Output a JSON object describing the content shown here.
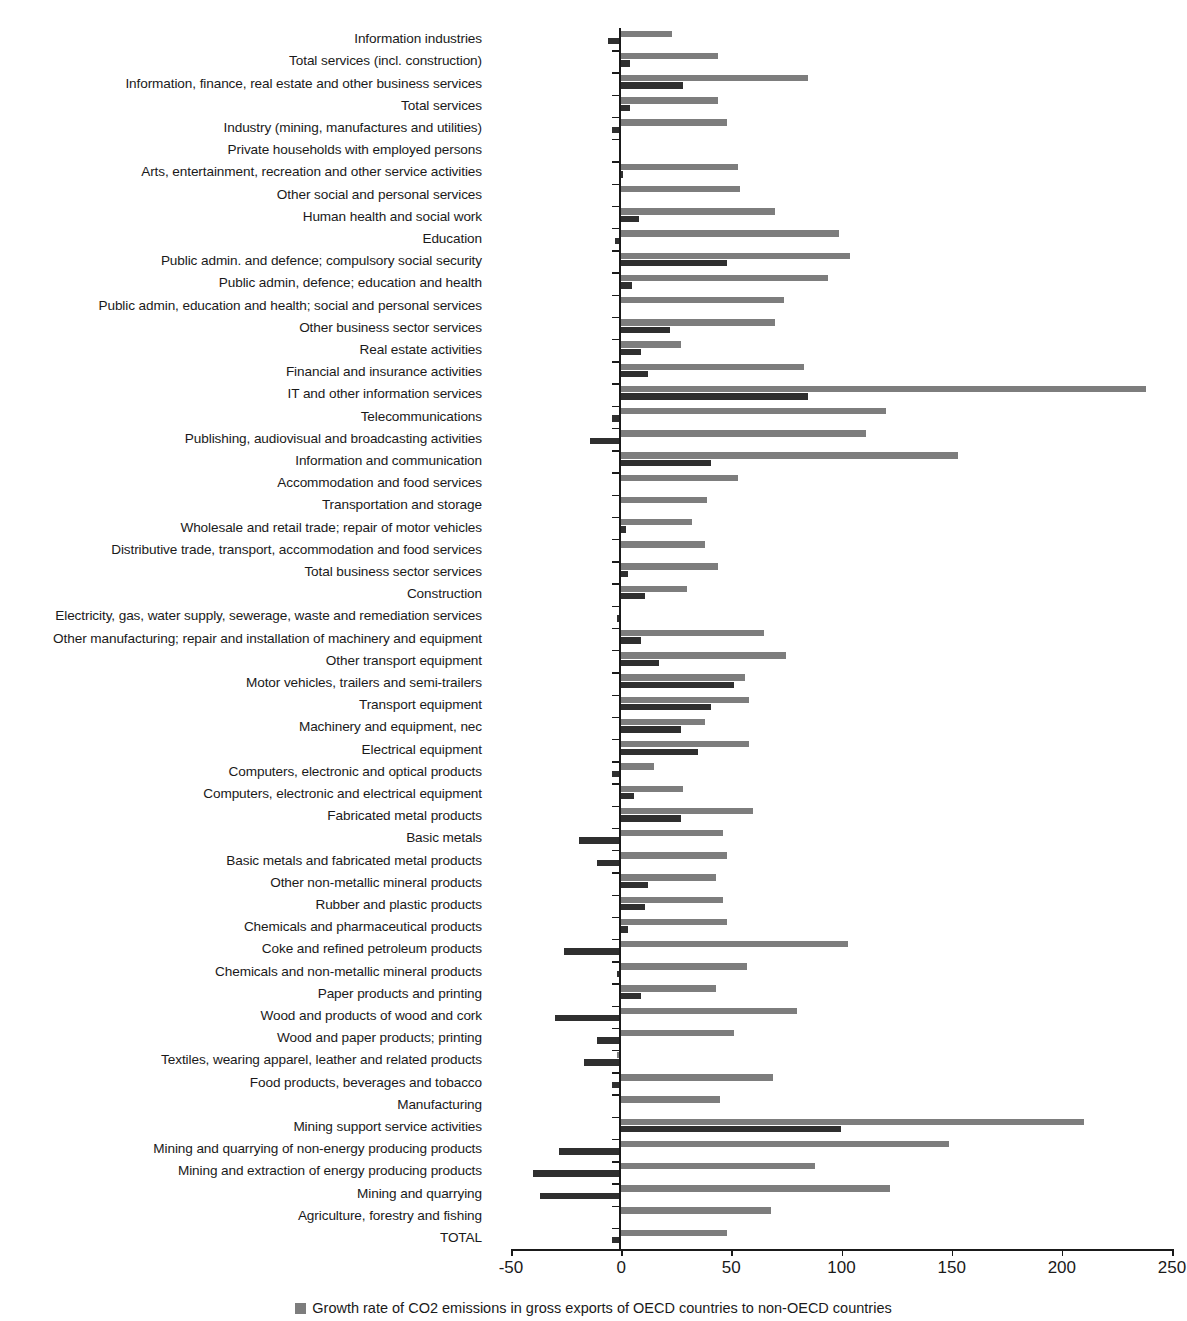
{
  "chart_data": {
    "type": "bar",
    "orientation": "horizontal",
    "title": "",
    "xlabel": "",
    "ylabel": "",
    "xlim": [
      -50,
      250
    ],
    "xticks": [
      -50,
      0,
      50,
      100,
      150,
      200,
      250
    ],
    "xticklabels": [
      "-50",
      "0",
      "50",
      "100",
      "150",
      "200",
      "250"
    ],
    "grid": false,
    "legend_position": "bottom",
    "colors": {
      "series0": "#7d7d7d",
      "series1": "#2f2f2f",
      "axis": "#1a1a1a",
      "background": "#ffffff"
    },
    "series": [
      {
        "name": "Growth rate of CO2 emissions in gross exports of OECD countries to non-OECD countries",
        "color": "#7d7d7d",
        "values": [
          23,
          44,
          85,
          44,
          48,
          0,
          53,
          54,
          70,
          99,
          104,
          94,
          74,
          70,
          27,
          83,
          238,
          120,
          111,
          153,
          53,
          39,
          32,
          38,
          44,
          30,
          0,
          65,
          75,
          56,
          58,
          38,
          58,
          15,
          28,
          60,
          46,
          48,
          43,
          46,
          48,
          103,
          57,
          43,
          80,
          51,
          -2,
          69,
          45,
          210,
          149,
          88,
          122,
          68,
          48
        ]
      },
      {
        "name": "Growth rate of CO2 emissions in gross exports of OECD countries",
        "color": "#2f2f2f",
        "values": [
          -6,
          4,
          28,
          4,
          -4,
          0,
          1,
          0,
          8,
          -3,
          48,
          5,
          0,
          22,
          9,
          12,
          85,
          -4,
          -14,
          41,
          0,
          0,
          2,
          0,
          3,
          11,
          -2,
          9,
          17,
          51,
          41,
          27,
          35,
          -4,
          6,
          27,
          -19,
          -11,
          12,
          11,
          3,
          -26,
          -2,
          9,
          -30,
          -11,
          -17,
          -4,
          0,
          100,
          -28,
          -40,
          -37,
          0,
          -4
        ]
      }
    ],
    "categories": [
      "Information industries",
      "Total services (incl. construction)",
      "Information, finance, real estate and other business services",
      "Total services",
      "Industry (mining, manufactures and utilities)",
      "Private households with employed persons",
      "Arts, entertainment, recreation and other service activities",
      "Other social and personal services",
      "Human health and social work",
      "Education",
      "Public admin. and defence; compulsory social security",
      "Public admin, defence; education and health",
      "Public admin, education and health; social and personal services",
      "Other business sector services",
      "Real estate activities",
      "Financial and insurance activities",
      "IT and other information services",
      "Telecommunications",
      "Publishing, audiovisual and broadcasting activities",
      "Information and communication",
      "Accommodation and food services",
      "Transportation and storage",
      "Wholesale and retail trade; repair of motor vehicles",
      "Distributive trade, transport, accommodation and food services",
      "Total business sector services",
      "Construction",
      "Electricity, gas, water supply, sewerage, waste and remediation services",
      "Other manufacturing; repair and installation of machinery and equipment",
      "Other transport equipment",
      "Motor vehicles, trailers and semi-trailers",
      "Transport equipment",
      "Machinery and equipment, nec",
      "Electrical equipment",
      "Computers, electronic and optical products",
      "Computers, electronic and electrical equipment",
      "Fabricated metal products",
      "Basic metals",
      "Basic metals and fabricated metal products",
      "Other non-metallic mineral products",
      "Rubber and plastic products",
      "Chemicals and pharmaceutical products",
      "Coke and refined petroleum products",
      "Chemicals and non-metallic mineral products",
      "Paper products and printing",
      "Wood and products of wood and cork",
      "Wood and paper products; printing",
      "Textiles, wearing apparel, leather and related products",
      "Food products, beverages and tobacco",
      "Manufacturing",
      "Mining support service activities",
      "Mining and quarrying of non-energy producing products",
      "Mining and extraction of energy producing products",
      "Mining and quarrying",
      "Agriculture, forestry and fishing",
      "TOTAL"
    ]
  },
  "legend": {
    "items": [
      {
        "label": "Growth rate of CO2 emissions in gross exports of OECD countries to non-OECD countries",
        "color": "#7d7d7d"
      }
    ]
  }
}
